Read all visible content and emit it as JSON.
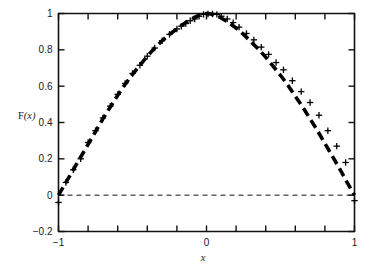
{
  "chart_data": {
    "type": "line",
    "title": "",
    "subtitle": "",
    "xlabel": "x",
    "ylabel": "F(x)",
    "xlim": [
      -1.08,
      1.08
    ],
    "ylim": [
      -0.2,
      1.0
    ],
    "grid": false,
    "legend": null,
    "x_ticks": [
      -1,
      -0.8,
      -0.6,
      -0.4,
      -0.2,
      0,
      0.2,
      0.4,
      0.6,
      0.8,
      1
    ],
    "x_tick_labels": [
      "-1",
      "",
      "",
      "",
      "",
      "0",
      "",
      "",
      "",
      "",
      "1"
    ],
    "y_ticks": [
      -0.2,
      0,
      0.2,
      0.4,
      0.6,
      0.8,
      1
    ],
    "y_tick_labels": [
      "-0.2",
      "0",
      "0.2",
      "0.4",
      "0.6",
      "0.8",
      "1"
    ],
    "series": [
      {
        "name": "fitted-curve",
        "style": "thick-dashed",
        "color": "#000000",
        "x": [
          -1.05,
          -1.0,
          -0.95,
          -0.9,
          -0.85,
          -0.8,
          -0.75,
          -0.7,
          -0.65,
          -0.6,
          -0.55,
          -0.5,
          -0.45,
          -0.4,
          -0.35,
          -0.3,
          -0.25,
          -0.2,
          -0.15,
          -0.1,
          -0.05,
          0.0,
          0.05,
          0.1,
          0.15,
          0.2,
          0.25,
          0.3,
          0.35,
          0.4,
          0.45,
          0.5,
          0.55,
          0.6,
          0.65,
          0.7,
          0.75,
          0.8,
          0.85,
          0.9,
          0.95,
          1.0,
          1.05
        ],
        "y": [
          -0.05,
          0.0,
          0.07,
          0.14,
          0.21,
          0.28,
          0.35,
          0.42,
          0.485,
          0.55,
          0.61,
          0.665,
          0.715,
          0.765,
          0.81,
          0.85,
          0.885,
          0.915,
          0.945,
          0.97,
          0.99,
          1.0,
          0.995,
          0.975,
          0.95,
          0.92,
          0.885,
          0.845,
          0.805,
          0.76,
          0.71,
          0.66,
          0.605,
          0.545,
          0.485,
          0.42,
          0.355,
          0.285,
          0.215,
          0.145,
          0.07,
          0.0,
          -0.05
        ]
      },
      {
        "name": "data-points",
        "style": "plus-markers",
        "color": "#000000",
        "x": [
          -1.0,
          -0.95,
          -0.9,
          -0.85,
          -0.8,
          -0.75,
          -0.7,
          -0.65,
          -0.6,
          -0.55,
          -0.5,
          -0.45,
          -0.4,
          -0.35,
          -0.3,
          -0.25,
          -0.2,
          -0.17,
          -0.14,
          -0.11,
          -0.08,
          -0.05,
          -0.02,
          0.01,
          0.04,
          0.07,
          0.1,
          0.14,
          0.18,
          0.22,
          0.27,
          0.32,
          0.37,
          0.42,
          0.47,
          0.52,
          0.58,
          0.64,
          0.7,
          0.76,
          0.82,
          0.88,
          0.94,
          1.0
        ],
        "y": [
          -0.04,
          0.07,
          0.14,
          0.2,
          0.29,
          0.355,
          0.425,
          0.49,
          0.555,
          0.615,
          0.67,
          0.715,
          0.765,
          0.81,
          0.85,
          0.885,
          0.915,
          0.93,
          0.945,
          0.96,
          0.97,
          0.985,
          0.995,
          1.0,
          1.0,
          0.995,
          0.985,
          0.97,
          0.95,
          0.925,
          0.89,
          0.855,
          0.815,
          0.775,
          0.73,
          0.69,
          0.63,
          0.57,
          0.51,
          0.44,
          0.355,
          0.27,
          0.18,
          -0.03
        ]
      },
      {
        "name": "zero-reference-line",
        "style": "thin-dashed",
        "color": "#111111",
        "x": [
          -1.0,
          1.0
        ],
        "y": [
          0,
          0
        ]
      }
    ]
  },
  "axes": {
    "y_axis_label": "F(x)",
    "y_axis_label_roman": "F",
    "y_axis_label_italic": "x",
    "x_axis_label": "x"
  }
}
